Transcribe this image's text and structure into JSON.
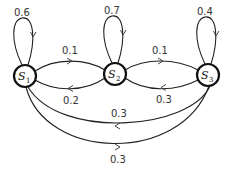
{
  "nodes": [
    {
      "id": "S1",
      "label": "S",
      "sub": "1"
    },
    {
      "id": "S2",
      "label": "S",
      "sub": "2"
    },
    {
      "id": "S3",
      "label": "S",
      "sub": "3"
    }
  ],
  "edges": {
    "s1_s1": {
      "from": "S1",
      "to": "S1",
      "label": "0.6"
    },
    "s2_s2": {
      "from": "S2",
      "to": "S2",
      "label": "0.7"
    },
    "s3_s3": {
      "from": "S3",
      "to": "S3",
      "label": "0.4"
    },
    "s1_s2": {
      "from": "S1",
      "to": "S2",
      "label": "0.1"
    },
    "s2_s1": {
      "from": "S2",
      "to": "S1",
      "label": "0.2"
    },
    "s2_s3": {
      "from": "S2",
      "to": "S3",
      "label": "0.1"
    },
    "s3_s2": {
      "from": "S3",
      "to": "S2",
      "label": "0.3"
    },
    "s3_s1": {
      "from": "S3",
      "to": "S1",
      "label": "0.3"
    },
    "s1_s3": {
      "from": "S1",
      "to": "S3",
      "label": "0.3"
    }
  }
}
